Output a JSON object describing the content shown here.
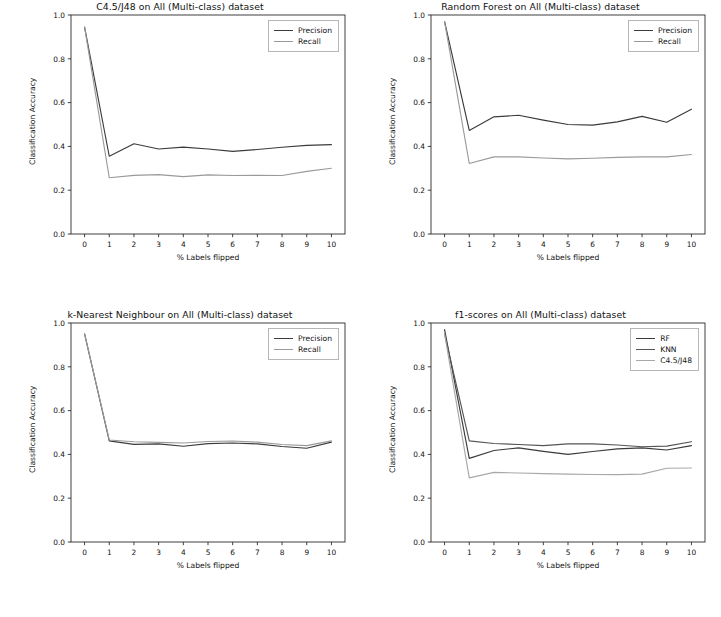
{
  "figure": {
    "width": 721,
    "height": 617,
    "background": "#ffffff",
    "panel_count": 4
  },
  "common": {
    "xlabel": "% Labels flipped",
    "ylabel": "Classification Accuracy",
    "xticks": [
      "0",
      "1",
      "2",
      "3",
      "4",
      "5",
      "6",
      "7",
      "8",
      "9",
      "10"
    ],
    "yticks": [
      "0.0",
      "0.2",
      "0.4",
      "0.6",
      "0.8",
      "1.0"
    ],
    "xlim": [
      -0.55,
      10.55
    ],
    "ylim": [
      0.0,
      1.0
    ]
  },
  "colors": {
    "precision": "#3b3b3b",
    "recall": "#9a9a9a",
    "rf": "#3b3b3b",
    "knn": "#555555",
    "c45": "#a8a8a8",
    "axis": "#2b2b2b",
    "legend_border": "#b6b6b6",
    "text": "#111111"
  },
  "chart_data": [
    {
      "id": "c45-j48",
      "type": "line",
      "title": "C4.5/J48 on All (Multi-class) dataset",
      "xlabel": "% Labels flipped",
      "ylabel": "Classification Accuracy",
      "x": [
        0,
        1,
        2,
        3,
        4,
        5,
        6,
        7,
        8,
        9,
        10
      ],
      "xlim": [
        -0.55,
        10.55
      ],
      "ylim": [
        0.0,
        1.0
      ],
      "grid": false,
      "legend_position": "upper right",
      "series": [
        {
          "name": "Precision",
          "color": "#3b3b3b",
          "values": [
            0.945,
            0.355,
            0.412,
            0.388,
            0.397,
            0.388,
            0.377,
            0.386,
            0.396,
            0.405,
            0.408
          ]
        },
        {
          "name": "Recall",
          "color": "#9a9a9a",
          "values": [
            0.945,
            0.257,
            0.268,
            0.271,
            0.262,
            0.27,
            0.267,
            0.268,
            0.267,
            0.286,
            0.3
          ]
        }
      ]
    },
    {
      "id": "random-forest",
      "type": "line",
      "title": "Random Forest on All (Multi-class) dataset",
      "xlabel": "% Labels flipped",
      "ylabel": "Classification Accuracy",
      "x": [
        0,
        1,
        2,
        3,
        4,
        5,
        6,
        7,
        8,
        9,
        10
      ],
      "xlim": [
        -0.55,
        10.55
      ],
      "ylim": [
        0.0,
        1.0
      ],
      "grid": false,
      "legend_position": "upper right",
      "series": [
        {
          "name": "Precision",
          "color": "#3b3b3b",
          "values": [
            0.97,
            0.473,
            0.535,
            0.542,
            0.52,
            0.5,
            0.497,
            0.512,
            0.537,
            0.51,
            0.57
          ]
        },
        {
          "name": "Recall",
          "color": "#9a9a9a",
          "values": [
            0.97,
            0.322,
            0.352,
            0.352,
            0.347,
            0.343,
            0.346,
            0.35,
            0.352,
            0.352,
            0.363
          ]
        }
      ]
    },
    {
      "id": "k-nearest-neighbour",
      "type": "line",
      "title": "k-Nearest Neighbour on All (Multi-class) dataset",
      "xlabel": "% Labels flipped",
      "ylabel": "Classification Accuracy",
      "x": [
        0,
        1,
        2,
        3,
        4,
        5,
        6,
        7,
        8,
        9,
        10
      ],
      "xlim": [
        -0.55,
        10.55
      ],
      "ylim": [
        0.0,
        1.0
      ],
      "grid": false,
      "legend_position": "upper right",
      "series": [
        {
          "name": "Precision",
          "color": "#3b3b3b",
          "values": [
            0.95,
            0.462,
            0.446,
            0.448,
            0.437,
            0.449,
            0.452,
            0.448,
            0.436,
            0.428,
            0.456
          ]
        },
        {
          "name": "Recall",
          "color": "#9a9a9a",
          "values": [
            0.95,
            0.466,
            0.458,
            0.455,
            0.452,
            0.459,
            0.461,
            0.456,
            0.445,
            0.44,
            0.462
          ]
        }
      ]
    },
    {
      "id": "f1-scores",
      "type": "line",
      "title": "f1-scores on All (Multi-class) dataset",
      "xlabel": "% Labels flipped",
      "ylabel": "Classification Accuracy",
      "x": [
        0,
        1,
        2,
        3,
        4,
        5,
        6,
        7,
        8,
        9,
        10
      ],
      "xlim": [
        -0.55,
        10.55
      ],
      "ylim": [
        0.0,
        1.0
      ],
      "grid": false,
      "legend_position": "upper right",
      "series": [
        {
          "name": "RF",
          "color": "#3b3b3b",
          "values": [
            0.97,
            0.382,
            0.418,
            0.43,
            0.414,
            0.4,
            0.413,
            0.425,
            0.43,
            0.42,
            0.44
          ]
        },
        {
          "name": "KNN",
          "color": "#555555",
          "values": [
            0.95,
            0.462,
            0.45,
            0.445,
            0.44,
            0.448,
            0.448,
            0.443,
            0.435,
            0.438,
            0.458
          ]
        },
        {
          "name": "C4.5/J48",
          "color": "#a8a8a8",
          "values": [
            0.95,
            0.293,
            0.318,
            0.315,
            0.312,
            0.31,
            0.308,
            0.308,
            0.31,
            0.337,
            0.338
          ]
        }
      ]
    }
  ]
}
